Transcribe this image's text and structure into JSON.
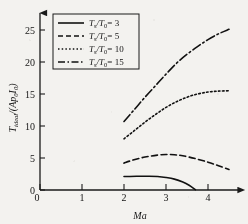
{
  "figure": {
    "background_color": "#f3f2ef",
    "ink_color": "#111111"
  },
  "axes": {
    "x_title": "Ma",
    "y_title": "T_ideal/(Ap0I0)",
    "y_title_main": "T",
    "y_title_sub": "ideal",
    "y_title_rest": "/(Ap",
    "y_title_sub2": "0",
    "y_title_rest2": "I",
    "y_title_sub3": "0",
    "y_title_close": ")",
    "x_ticks": [
      "0",
      "1",
      "2",
      "3",
      "4"
    ],
    "y_ticks": [
      "0",
      "5",
      "10",
      "15",
      "20",
      "25"
    ],
    "xlim": [
      0,
      4.6
    ],
    "ylim": [
      0,
      26.5
    ],
    "grid": false
  },
  "legend": {
    "position": "upper-left",
    "boxed": true,
    "entries": [
      {
        "label_var": "Ts/T0",
        "label_num": "T",
        "sub": "s",
        "slash": "/T",
        "sub2": "0",
        "eq": "= 3",
        "style": "solid"
      },
      {
        "label_var": "Ts/T0",
        "label_num": "T",
        "sub": "s",
        "slash": "/T",
        "sub2": "0",
        "eq": "= 5",
        "style": "dashed"
      },
      {
        "label_var": "Ts/T0",
        "label_num": "T",
        "sub": "s",
        "slash": "/T",
        "sub2": "0",
        "eq": "= 10",
        "style": "dotted"
      },
      {
        "label_var": "Ts/T0",
        "label_num": "T",
        "sub": "s",
        "slash": "/T",
        "sub2": "0",
        "eq": "= 15",
        "style": "dashdot"
      }
    ]
  },
  "chart_data": {
    "type": "line",
    "title": "",
    "xlabel": "Ma",
    "ylabel": "T_ideal/(Ap0I0)",
    "xlim": [
      0,
      4.6
    ],
    "ylim": [
      0,
      26.5
    ],
    "grid": false,
    "legend_position": "upper-left",
    "series": [
      {
        "name": "Ts/T0 = 3",
        "style": "solid",
        "x": [
          2.0,
          2.3,
          2.6,
          2.8,
          3.0,
          3.2,
          3.4,
          3.55,
          3.7
        ],
        "values": [
          2.1,
          2.15,
          2.15,
          2.1,
          1.95,
          1.7,
          1.25,
          0.75,
          0.05
        ]
      },
      {
        "name": "Ts/T0 = 5",
        "style": "dashed",
        "x": [
          2.0,
          2.2,
          2.5,
          2.8,
          3.0,
          3.2,
          3.4,
          3.7,
          4.0,
          4.25,
          4.5
        ],
        "values": [
          4.2,
          4.65,
          5.15,
          5.45,
          5.55,
          5.5,
          5.35,
          4.9,
          4.35,
          3.8,
          3.2
        ]
      },
      {
        "name": "Ts/T0 = 10",
        "style": "dotted",
        "x": [
          2.0,
          2.25,
          2.5,
          2.75,
          3.0,
          3.25,
          3.5,
          3.75,
          4.0,
          4.25,
          4.5
        ],
        "values": [
          8.0,
          9.3,
          10.6,
          11.8,
          12.9,
          13.8,
          14.5,
          15.0,
          15.3,
          15.45,
          15.5
        ]
      },
      {
        "name": "Ts/T0 = 15",
        "style": "dashdot",
        "x": [
          2.0,
          2.25,
          2.5,
          2.75,
          3.0,
          3.25,
          3.5,
          3.75,
          4.0,
          4.25,
          4.5
        ],
        "values": [
          10.7,
          12.6,
          14.5,
          16.3,
          18.1,
          19.8,
          21.2,
          22.4,
          23.5,
          24.4,
          25.1
        ]
      }
    ]
  }
}
